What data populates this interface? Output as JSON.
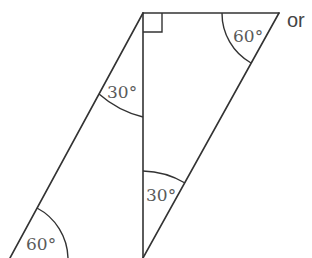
{
  "diagram": {
    "colors": {
      "line": "#333333",
      "label": "#5a5a5a",
      "background": "#ffffff"
    },
    "vertices": {
      "top_left": [
        143,
        13
      ],
      "top_right": [
        279,
        13
      ],
      "bottom_left": [
        10,
        258
      ],
      "bottom_middle": [
        143,
        258
      ]
    },
    "angles": [
      {
        "id": "top-right",
        "label": "60°",
        "vertex": "top_right"
      },
      {
        "id": "upper-left",
        "label": "30°",
        "vertex": "top_left"
      },
      {
        "id": "lower-middle",
        "label": "30°",
        "vertex": "bottom_middle"
      },
      {
        "id": "bottom-left",
        "label": "60°",
        "vertex": "bottom_left"
      }
    ],
    "right_angle_marker": {
      "vertex": "top_left",
      "size": 19
    },
    "side_text": "or"
  }
}
